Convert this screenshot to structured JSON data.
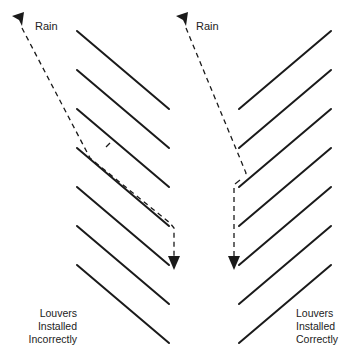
{
  "diagram": {
    "left_panel": {
      "rain_label": "Rain",
      "caption_lines": [
        "Louvers",
        "Installed",
        "Incorrectly"
      ],
      "louver_count": 7,
      "louver_orientation": "slanted down-right"
    },
    "right_panel": {
      "rain_label": "Rain",
      "caption_lines": [
        "Louvers",
        "Installed",
        "Correctly"
      ],
      "louver_count": 7,
      "louver_orientation": "slanted up-right"
    },
    "colors": {
      "stroke": "#1a1a1a",
      "background": "#ffffff"
    }
  }
}
